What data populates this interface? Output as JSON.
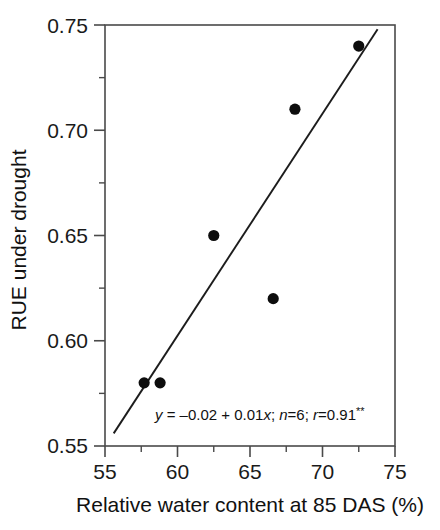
{
  "figure": {
    "title": "",
    "background": "#ffffff",
    "foreground": "#1a1a1a"
  },
  "axes": {
    "x": {
      "label": "Relative water content at 85 DAS (%)",
      "ticks": [
        "55",
        "60",
        "65",
        "70",
        "75"
      ],
      "min": 55,
      "max": 75,
      "minor_step": 2.5
    },
    "y": {
      "label": "RUE under drought",
      "ticks": [
        "0.55",
        "0.60",
        "0.65",
        "0.70",
        "0.75"
      ],
      "min": 0.55,
      "max": 0.75,
      "minor_step": 0.025
    }
  },
  "annotation": {
    "equation_y": "y",
    "equation_body": " = –0.02 + 0.01",
    "equation_x": "x",
    "separator1": "; ",
    "n_symbol": "n",
    "n_value": "=6; ",
    "r_symbol": "r",
    "r_value": "=0.91",
    "significance": "**",
    "full_text": "y = –0.02 + 0.01x; n=6; r=0.91**"
  },
  "chart_data": {
    "type": "scatter",
    "title": "",
    "xlabel": "Relative water content at 85 DAS (%)",
    "ylabel": "RUE under drought",
    "xlim": [
      55,
      75
    ],
    "ylim": [
      0.55,
      0.75
    ],
    "xticks": [
      55,
      60,
      65,
      70,
      75
    ],
    "yticks": [
      0.55,
      0.6,
      0.65,
      0.7,
      0.75
    ],
    "grid": false,
    "legend": null,
    "marker": "filled-circle",
    "marker_color": "#0d0d0d",
    "x": [
      57.7,
      58.8,
      62.5,
      66.6,
      68.1,
      72.5
    ],
    "y": [
      0.58,
      0.58,
      0.65,
      0.62,
      0.71,
      0.74
    ],
    "points": [
      {
        "x": 57.7,
        "y": 0.58
      },
      {
        "x": 58.8,
        "y": 0.58
      },
      {
        "x": 62.5,
        "y": 0.65
      },
      {
        "x": 66.6,
        "y": 0.62
      },
      {
        "x": 68.1,
        "y": 0.71
      },
      {
        "x": 72.5,
        "y": 0.74
      }
    ],
    "fit_line": {
      "type": "linear",
      "intercept": -0.02,
      "slope": 0.01,
      "x_start": 55.6,
      "x_end": 73.8,
      "y_start": 0.556,
      "y_end": 0.748,
      "n": 6,
      "r": 0.91,
      "significance": "**",
      "equation": "y = –0.02 + 0.01x"
    }
  }
}
